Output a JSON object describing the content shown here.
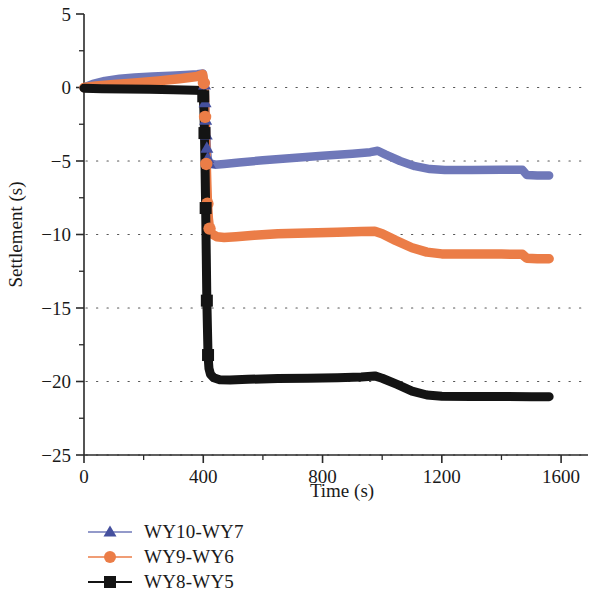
{
  "chart_data": {
    "type": "line",
    "title": "",
    "xlabel": "Time (s)",
    "ylabel": "Settlement (s)",
    "xlim": [
      0,
      1650
    ],
    "ylim": [
      -25,
      5
    ],
    "xticks": [
      0,
      400,
      800,
      1200,
      1600
    ],
    "xtick_labels": [
      "0",
      "400",
      "800",
      "1200",
      "1600"
    ],
    "yticks": [
      5,
      0,
      -5,
      -10,
      -15,
      -20,
      -25
    ],
    "ytick_labels": [
      "5",
      "0",
      "−5",
      "−10",
      "−15",
      "−20",
      "−25"
    ],
    "x_minor_step": 200,
    "y_minor_step": 2.5,
    "grid": "horizontal-dotted-major",
    "legend_position": "below-left",
    "series": [
      {
        "name": "WY10-WY7",
        "color": "#6f78b9",
        "marker": "triangle",
        "points": [
          [
            0,
            0.0
          ],
          [
            30,
            0.25
          ],
          [
            70,
            0.45
          ],
          [
            120,
            0.6
          ],
          [
            170,
            0.68
          ],
          [
            230,
            0.75
          ],
          [
            290,
            0.8
          ],
          [
            340,
            0.85
          ],
          [
            380,
            0.9
          ],
          [
            398,
            0.95
          ],
          [
            404,
            0.2
          ],
          [
            406,
            -1.0
          ],
          [
            408,
            -2.2
          ],
          [
            410,
            -3.2
          ],
          [
            412,
            -4.1
          ],
          [
            415,
            -4.8
          ],
          [
            420,
            -5.15
          ],
          [
            440,
            -5.25
          ],
          [
            470,
            -5.2
          ],
          [
            520,
            -5.1
          ],
          [
            600,
            -4.95
          ],
          [
            700,
            -4.8
          ],
          [
            800,
            -4.65
          ],
          [
            900,
            -4.5
          ],
          [
            960,
            -4.4
          ],
          [
            985,
            -4.3
          ],
          [
            1010,
            -4.55
          ],
          [
            1060,
            -5.0
          ],
          [
            1110,
            -5.35
          ],
          [
            1160,
            -5.55
          ],
          [
            1210,
            -5.62
          ],
          [
            1300,
            -5.62
          ],
          [
            1400,
            -5.6
          ],
          [
            1470,
            -5.6
          ],
          [
            1485,
            -5.95
          ],
          [
            1520,
            -5.98
          ],
          [
            1560,
            -5.98
          ]
        ]
      },
      {
        "name": "WY9-WY6",
        "color": "#eb7d47",
        "marker": "circle",
        "points": [
          [
            0,
            0.0
          ],
          [
            40,
            0.1
          ],
          [
            100,
            0.2
          ],
          [
            170,
            0.3
          ],
          [
            250,
            0.45
          ],
          [
            320,
            0.6
          ],
          [
            380,
            0.75
          ],
          [
            398,
            0.9
          ],
          [
            402,
            0.3
          ],
          [
            404,
            -0.6
          ],
          [
            406,
            -2.0
          ],
          [
            408,
            -3.6
          ],
          [
            410,
            -5.2
          ],
          [
            412,
            -6.6
          ],
          [
            414,
            -7.9
          ],
          [
            417,
            -8.9
          ],
          [
            421,
            -9.6
          ],
          [
            428,
            -9.95
          ],
          [
            445,
            -10.15
          ],
          [
            470,
            -10.2
          ],
          [
            510,
            -10.15
          ],
          [
            570,
            -10.05
          ],
          [
            650,
            -9.95
          ],
          [
            750,
            -9.9
          ],
          [
            850,
            -9.85
          ],
          [
            930,
            -9.8
          ],
          [
            975,
            -9.78
          ],
          [
            1000,
            -9.95
          ],
          [
            1045,
            -10.4
          ],
          [
            1100,
            -10.9
          ],
          [
            1150,
            -11.2
          ],
          [
            1200,
            -11.32
          ],
          [
            1290,
            -11.33
          ],
          [
            1400,
            -11.33
          ],
          [
            1470,
            -11.35
          ],
          [
            1485,
            -11.62
          ],
          [
            1520,
            -11.65
          ],
          [
            1560,
            -11.65
          ]
        ]
      },
      {
        "name": "WY8-WY5",
        "color": "#141414",
        "marker": "square",
        "points": [
          [
            0,
            -0.05
          ],
          [
            60,
            -0.08
          ],
          [
            140,
            -0.1
          ],
          [
            220,
            -0.12
          ],
          [
            300,
            -0.15
          ],
          [
            370,
            -0.18
          ],
          [
            396,
            -0.2
          ],
          [
            400,
            -0.6
          ],
          [
            402,
            -1.5
          ],
          [
            404,
            -3.1
          ],
          [
            406,
            -5.5
          ],
          [
            408,
            -8.2
          ],
          [
            410,
            -11.3
          ],
          [
            412,
            -14.5
          ],
          [
            414,
            -16.4
          ],
          [
            416,
            -18.2
          ],
          [
            419,
            -19.1
          ],
          [
            424,
            -19.5
          ],
          [
            435,
            -19.75
          ],
          [
            455,
            -19.88
          ],
          [
            490,
            -19.9
          ],
          [
            550,
            -19.85
          ],
          [
            650,
            -19.8
          ],
          [
            750,
            -19.78
          ],
          [
            850,
            -19.75
          ],
          [
            930,
            -19.7
          ],
          [
            975,
            -19.62
          ],
          [
            1000,
            -19.78
          ],
          [
            1050,
            -20.2
          ],
          [
            1100,
            -20.65
          ],
          [
            1150,
            -20.92
          ],
          [
            1200,
            -21.0
          ],
          [
            1300,
            -21.02
          ],
          [
            1420,
            -21.02
          ],
          [
            1500,
            -21.03
          ],
          [
            1560,
            -21.03
          ]
        ]
      }
    ]
  },
  "legend": {
    "items": [
      {
        "label": "WY10-WY7",
        "color": "#6f78b9",
        "marker": "triangle"
      },
      {
        "label": "WY9-WY6",
        "color": "#eb7d47",
        "marker": "circle"
      },
      {
        "label": "WY8-WY5",
        "color": "#141414",
        "marker": "square"
      }
    ]
  }
}
